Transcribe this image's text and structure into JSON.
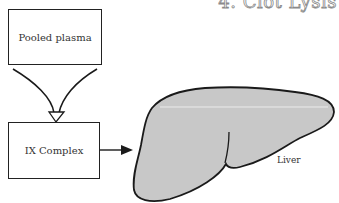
{
  "title": "4. Clot Lysis",
  "nodes": {
    "pooled_plasma": "Pooled plasma",
    "ix_complex": "IX Complex",
    "liver": "Liver"
  },
  "edges": [
    {
      "from": "Pooled plasma",
      "to": "IX Complex",
      "style": "converging funnel arrow"
    },
    {
      "from": "IX Complex",
      "to": "Liver",
      "style": "solid arrow"
    }
  ],
  "colors": {
    "liver_fill": "#c8c8c8",
    "stroke": "#1a1a1a",
    "background": "#ffffff"
  }
}
